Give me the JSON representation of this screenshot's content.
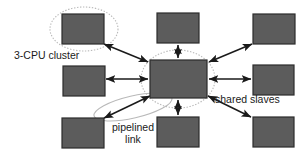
{
  "diagram": {
    "type": "node-link-topology",
    "colors": {
      "node_fill": "#5c5c5c",
      "node_border": "#2b2b2b",
      "arrow": "#1a1a1a",
      "annotation_ellipse": "#b9b9b9",
      "background": "#ffffff",
      "text": "#1a1a1a"
    },
    "labels": {
      "cluster": "3-CPU cluster",
      "shared_slaves": "shared slaves",
      "pipelined_line1": "pipelined",
      "pipelined_line2": "link"
    },
    "nodes": [
      {
        "id": "top-left",
        "x": 62,
        "y": 14,
        "w": 42,
        "h": 30
      },
      {
        "id": "top-middle",
        "x": 157,
        "y": 13,
        "w": 42,
        "h": 30
      },
      {
        "id": "top-right",
        "x": 253,
        "y": 14,
        "w": 42,
        "h": 30
      },
      {
        "id": "middle-left",
        "x": 63,
        "y": 66,
        "w": 42,
        "h": 30
      },
      {
        "id": "center",
        "x": 150,
        "y": 60,
        "w": 57,
        "h": 38
      },
      {
        "id": "middle-right",
        "x": 253,
        "y": 65,
        "w": 41,
        "h": 30
      },
      {
        "id": "bottom-left",
        "x": 62,
        "y": 118,
        "w": 42,
        "h": 30
      },
      {
        "id": "bottom-middle",
        "x": 157,
        "y": 117,
        "w": 42,
        "h": 30
      },
      {
        "id": "bottom-right",
        "x": 253,
        "y": 117,
        "w": 41,
        "h": 30
      }
    ],
    "links": [
      {
        "from": "center",
        "to": "top-left",
        "style": "double-arrow"
      },
      {
        "from": "center",
        "to": "top-middle",
        "style": "double-arrow"
      },
      {
        "from": "center",
        "to": "top-right",
        "style": "double-arrow"
      },
      {
        "from": "center",
        "to": "middle-left",
        "style": "double-arrow"
      },
      {
        "from": "center",
        "to": "middle-right",
        "style": "double-arrow"
      },
      {
        "from": "center",
        "to": "bottom-left",
        "style": "double-arrow"
      },
      {
        "from": "center",
        "to": "bottom-middle",
        "style": "double-arrow"
      },
      {
        "from": "center",
        "to": "bottom-right",
        "style": "double-arrow"
      }
    ],
    "annotations": [
      {
        "id": "cluster-ellipse",
        "shape": "ellipse",
        "cx": 84,
        "cy": 29,
        "rx": 34,
        "ry": 22,
        "rotate": 0,
        "dashed": true
      },
      {
        "id": "slaves-ellipse",
        "shape": "ellipse",
        "cx": 178,
        "cy": 79,
        "rx": 37,
        "ry": 29,
        "rotate": 0,
        "dashed": true
      },
      {
        "id": "pipelined-ellipse",
        "shape": "ellipse",
        "cx": 133,
        "cy": 107,
        "rx": 40,
        "ry": 11,
        "rotate": -13,
        "dashed": false
      }
    ]
  }
}
